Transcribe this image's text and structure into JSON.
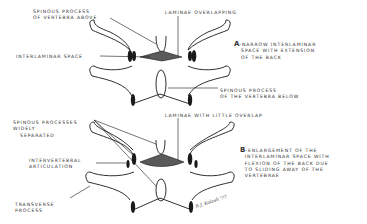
{
  "figure": {
    "panel_a": {
      "letter": "A",
      "caption_line1": "-NARROW INTERLAMINAR",
      "caption_line2": "SPACE WITH EXTENSION",
      "caption_line3": "OF THE BACK",
      "labels": {
        "spinous_above_1": "SPINOUS PROCESS",
        "spinous_above_2": "OF VERTEBRA ABOVE",
        "laminae": "LAMINAE OVERLAPPING",
        "interlaminar": "INTERLAMINAR SPACE",
        "spinous_below_1": "SPINOUS PROCESS",
        "spinous_below_2": "OF THE VERTEBRA BELOW"
      }
    },
    "panel_b": {
      "letter": "B",
      "caption_line1": "-ENLARGEMENT OF THE",
      "caption_line2": "INTERLAMINAR SPACE WITH",
      "caption_line3": "FLEXION OF THE BACK DUE",
      "caption_line4": "TO SLIDING AWAY OF THE",
      "caption_line5": "VERTEBRAE",
      "labels": {
        "spinous_sep_1": "SPINOUS PROCESSES",
        "spinous_sep_2": "WIDELY",
        "spinous_sep_3": "SEPARATED",
        "laminae": "LAMINAE WITH LITTLE OVERLAP",
        "articulation_1": "INTERVERTEBRAL",
        "articulation_2": "ARTICULATION",
        "transverse_1": "TRANSVERSE",
        "transverse_2": "PROCESS"
      }
    },
    "signature": "R.J. Kolesh '77",
    "colors": {
      "ink": "#1a1a1a",
      "fill": "#5a5a5a",
      "paper": "#ffffff"
    }
  }
}
